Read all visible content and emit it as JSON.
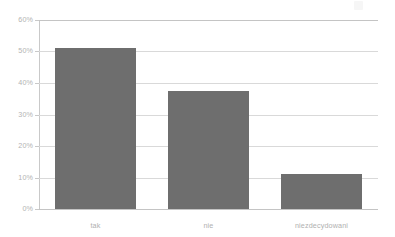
{
  "chart_data": {
    "type": "bar",
    "title": "",
    "subtitle": "",
    "xlabel": "",
    "ylabel": "",
    "categories": [
      "tak",
      "nie",
      "niezdecydowani"
    ],
    "values": [
      51,
      37.5,
      11
    ],
    "ylim": [
      0,
      60
    ],
    "ytick_values": [
      0,
      10,
      20,
      30,
      40,
      50,
      60
    ],
    "ytick_labels": [
      "0%",
      "10%",
      "20%",
      "30%",
      "40%",
      "50%",
      "60%"
    ],
    "grid": true,
    "legend": false,
    "legend_position": "none",
    "series": [
      {
        "name": "",
        "values": [
          51,
          37.5,
          11
        ]
      }
    ],
    "colors": {
      "bar": "#6e6e6e",
      "gridline": "#d9d9d9",
      "axis": "#c4c4c4",
      "tick_label": "#b3b3b3",
      "background": "#ffffff"
    }
  }
}
